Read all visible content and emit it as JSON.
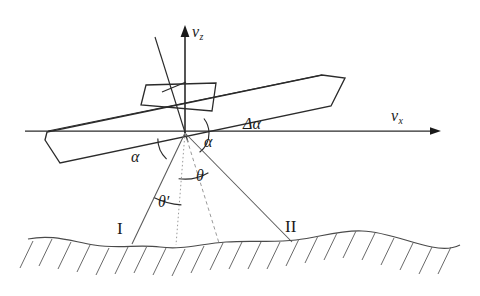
{
  "figure": {
    "background_color": "#ffffff",
    "ink_color": "#1a1a1a",
    "faint_ink_color": "#6f6f6f"
  },
  "labels": {
    "v_z": "v",
    "v_z_sub": "z",
    "v_x": "v",
    "v_x_sub": "x",
    "delta_alpha": "Δα",
    "alpha_left": "α",
    "alpha_right": "α",
    "theta": "θ",
    "theta_prime": "θ′",
    "beam_1": "I",
    "beam_2": "II"
  },
  "axes": {
    "vertical": {
      "name": "v_z",
      "from": [
        185,
        133
      ],
      "to": [
        185,
        27
      ],
      "arrow": true
    },
    "horizontal": {
      "name": "v_x",
      "from": [
        25,
        131
      ],
      "to": [
        441,
        131
      ],
      "arrow": true
    },
    "origin": [
      185,
      133
    ]
  },
  "platform": {
    "name": "aircraft-body",
    "tilt_deg": -11.5,
    "body_polygon": [
      [
        45,
        140
      ],
      [
        60,
        163
      ],
      [
        330,
        106
      ],
      [
        344,
        78
      ],
      [
        322,
        75
      ],
      [
        48,
        131
      ]
    ],
    "pod_polygon": [
      [
        141,
        104
      ],
      [
        147,
        86
      ],
      [
        216,
        84
      ],
      [
        212,
        110
      ]
    ],
    "normal_axis": {
      "from": [
        155,
        37
      ],
      "to": [
        186,
        137
      ]
    },
    "tick_mark": {
      "from": [
        164,
        91
      ],
      "to": [
        184,
        83
      ]
    }
  },
  "beams": {
    "left_solid": {
      "from": [
        185,
        133
      ],
      "to": [
        133,
        243
      ],
      "style": "solid"
    },
    "center_dotted": {
      "from": [
        185,
        133
      ],
      "to": [
        176,
        244
      ],
      "style": "dotted"
    },
    "mid_dashed": {
      "from": [
        185,
        133
      ],
      "to": [
        218,
        243
      ],
      "style": "dashed"
    },
    "right_solid": {
      "from": [
        185,
        133
      ],
      "to": [
        291,
        241
      ],
      "style": "solid"
    }
  },
  "angle_arcs": [
    {
      "name": "alpha-left-arc",
      "cx": 185,
      "cy": 133,
      "r": 28
    },
    {
      "name": "alpha-right-arc",
      "cx": 185,
      "cy": 133,
      "r": 24
    },
    {
      "name": "theta-arc",
      "cx": 185,
      "cy": 133,
      "r": 46
    },
    {
      "name": "theta-prime-arc",
      "cx": 185,
      "cy": 133,
      "r": 72
    }
  ],
  "terrain": {
    "name": "ground-surface",
    "hatching": true,
    "baseline_y": 245,
    "footprint_1_x": 133,
    "footprint_2_x": 291
  }
}
